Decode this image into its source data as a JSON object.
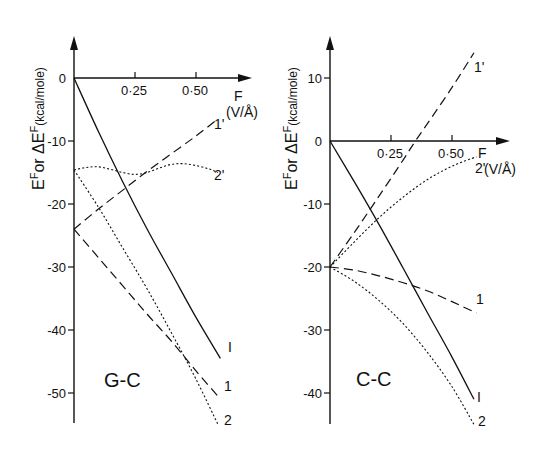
{
  "chart_data": [
    {
      "type": "line",
      "title": "G-C",
      "xlabel": "F (V/Å)",
      "ylabel": "E^F or ΔE^F (kcal/mole)",
      "xticks": [
        0.25,
        0.5
      ],
      "xtick_labels": [
        "0·25",
        "0·50"
      ],
      "yticks": [
        0,
        -10,
        -20,
        -30,
        -40,
        -50
      ],
      "ytick_labels": [
        "0",
        "-10",
        "-20",
        "-30",
        "-40",
        "-50"
      ],
      "xlim": [
        0,
        0.66
      ],
      "ylim": [
        -56,
        6
      ],
      "grid": false,
      "series": [
        {
          "name": "I",
          "style": "solid",
          "x": [
            0,
            0.1,
            0.2,
            0.3,
            0.4,
            0.5,
            0.6
          ],
          "y": [
            0,
            -8.5,
            -16.5,
            -24,
            -31,
            -38,
            -44.5
          ]
        },
        {
          "name": "1",
          "style": "dashed",
          "x": [
            0,
            0.1,
            0.2,
            0.3,
            0.4,
            0.5,
            0.59
          ],
          "y": [
            -24,
            -28.5,
            -33,
            -37.5,
            -41.8,
            -46.5,
            -50.5
          ]
        },
        {
          "name": "2",
          "style": "dotted",
          "x": [
            0,
            0.1,
            0.2,
            0.3,
            0.4,
            0.5,
            0.59
          ],
          "y": [
            -14.6,
            -20.5,
            -27,
            -33.5,
            -40.5,
            -47.8,
            -55
          ]
        },
        {
          "name": "1'",
          "style": "dashed",
          "x": [
            0,
            0.1,
            0.2,
            0.3,
            0.4,
            0.5,
            0.59
          ],
          "y": [
            -24,
            -20.8,
            -17.8,
            -14.8,
            -12,
            -9.2,
            -6.5
          ]
        },
        {
          "name": "2'",
          "style": "dotted",
          "x": [
            0,
            0.05,
            0.1,
            0.15,
            0.2,
            0.25,
            0.3,
            0.35,
            0.4,
            0.45,
            0.5,
            0.55,
            0.59
          ],
          "y": [
            -14.6,
            -14.2,
            -14.1,
            -14.5,
            -15.0,
            -15.3,
            -15.0,
            -14.3,
            -13.7,
            -13.6,
            -13.9,
            -14.4,
            -15.0
          ]
        }
      ]
    },
    {
      "type": "line",
      "title": "C-C",
      "xlabel": "F (V/Å)",
      "ylabel": "E^F or ΔE^F (kcal/mole)",
      "xticks": [
        0.25,
        0.5
      ],
      "xtick_labels": [
        "0·25",
        "0·50"
      ],
      "yticks": [
        10,
        0,
        -10,
        -20,
        -30,
        -40
      ],
      "ytick_labels": [
        "10",
        "0",
        "-10",
        "-20",
        "-30",
        "-40"
      ],
      "xlim": [
        0,
        0.66
      ],
      "ylim": [
        -45,
        16
      ],
      "grid": false,
      "series": [
        {
          "name": "I",
          "style": "solid",
          "x": [
            0,
            0.1,
            0.2,
            0.3,
            0.4,
            0.5,
            0.59
          ],
          "y": [
            0,
            -6.5,
            -13.2,
            -20.2,
            -27.3,
            -34.3,
            -41
          ]
        },
        {
          "name": "1",
          "style": "dashed",
          "x": [
            0,
            0.1,
            0.2,
            0.3,
            0.4,
            0.5,
            0.6
          ],
          "y": [
            -20,
            -20.5,
            -21.4,
            -22.5,
            -23.8,
            -25.5,
            -27.3
          ]
        },
        {
          "name": "2",
          "style": "dotted",
          "x": [
            0,
            0.1,
            0.2,
            0.3,
            0.4,
            0.5,
            0.59
          ],
          "y": [
            -20,
            -22.3,
            -25.3,
            -29,
            -33.6,
            -39,
            -45
          ]
        },
        {
          "name": "1'",
          "style": "dashed",
          "x": [
            0,
            0.1,
            0.2,
            0.3,
            0.35,
            0.4,
            0.5,
            0.59
          ],
          "y": [
            -20,
            -14.5,
            -8.8,
            -3,
            0,
            2.8,
            8.5,
            14
          ]
        },
        {
          "name": "2'",
          "style": "dotted",
          "x": [
            0,
            0.1,
            0.2,
            0.3,
            0.4,
            0.5,
            0.6
          ],
          "y": [
            -20,
            -16,
            -12.2,
            -8.9,
            -6.1,
            -4,
            -2.5
          ]
        }
      ]
    }
  ],
  "labels": {
    "left": {
      "title": "G-C",
      "ylabel": "EF or ΔEF(kcal/mole)",
      "x_axis_name": "F",
      "x_unit": "(V/Å)",
      "curve_labels": {
        "I": "I",
        "1": "1",
        "2": "2",
        "1p": "1'",
        "2p": "2'"
      }
    },
    "right": {
      "title": "C-C",
      "ylabel": "EF or ΔEF(kcal/mole)",
      "x_axis_name": "F",
      "x_unit": "(V/Å)",
      "curve_labels": {
        "I": "I",
        "1": "1",
        "2": "2",
        "1p": "1'",
        "2p": "2'"
      }
    }
  }
}
